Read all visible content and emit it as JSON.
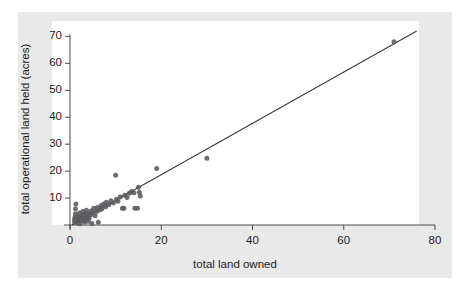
{
  "chart_data": {
    "type": "scatter",
    "title": "",
    "xlabel": "total land owned",
    "ylabel": "total operational land held (acres)",
    "xlim": [
      0,
      80
    ],
    "ylim": [
      0,
      72
    ],
    "xticks": [
      0,
      20,
      40,
      60,
      80
    ],
    "yticks": [
      10,
      20,
      30,
      40,
      50,
      60,
      70
    ],
    "grid": false,
    "legend": null,
    "point_color": "#5a5a60",
    "line_color": "#3c3c42",
    "panel_color": "#ffffff",
    "figure_color": "#e9e9e9",
    "fit_line": {
      "type": "linear",
      "x_start": 0.4,
      "y_start": 0.0,
      "x_end": 76.0,
      "y_end": 72.0
    },
    "points": [
      [
        1.0,
        1.0
      ],
      [
        1.0,
        2.0
      ],
      [
        1.1,
        3.0
      ],
      [
        1.2,
        4.2
      ],
      [
        1.2,
        6.0
      ],
      [
        1.3,
        7.8
      ],
      [
        1.4,
        1.2
      ],
      [
        1.5,
        2.4
      ],
      [
        1.6,
        0.8
      ],
      [
        1.8,
        3.4
      ],
      [
        2.0,
        1.5
      ],
      [
        2.0,
        2.8
      ],
      [
        2.1,
        4.5
      ],
      [
        2.2,
        0.5
      ],
      [
        2.4,
        2.0
      ],
      [
        2.5,
        3.2
      ],
      [
        2.6,
        1.8
      ],
      [
        2.8,
        5.0
      ],
      [
        3.0,
        2.2
      ],
      [
        3.0,
        3.6
      ],
      [
        3.2,
        1.0
      ],
      [
        3.4,
        4.0
      ],
      [
        3.5,
        2.6
      ],
      [
        3.6,
        5.5
      ],
      [
        3.8,
        3.0
      ],
      [
        4.0,
        4.4
      ],
      [
        4.0,
        1.4
      ],
      [
        4.2,
        2.5
      ],
      [
        4.5,
        3.8
      ],
      [
        4.6,
        5.2
      ],
      [
        4.8,
        0.6
      ],
      [
        5.0,
        4.6
      ],
      [
        5.2,
        6.2
      ],
      [
        5.5,
        3.4
      ],
      [
        5.8,
        5.0
      ],
      [
        6.0,
        6.5
      ],
      [
        6.2,
        1.0
      ],
      [
        6.5,
        5.6
      ],
      [
        6.8,
        7.2
      ],
      [
        7.0,
        6.0
      ],
      [
        7.4,
        7.8
      ],
      [
        7.8,
        6.8
      ],
      [
        8.0,
        8.4
      ],
      [
        8.5,
        7.5
      ],
      [
        9.0,
        9.0
      ],
      [
        9.5,
        8.2
      ],
      [
        10.0,
        18.5
      ],
      [
        10.2,
        9.6
      ],
      [
        10.5,
        8.8
      ],
      [
        11.0,
        10.4
      ],
      [
        11.5,
        6.2
      ],
      [
        11.8,
        6.2
      ],
      [
        12.0,
        11.0
      ],
      [
        12.5,
        10.2
      ],
      [
        13.0,
        11.8
      ],
      [
        13.5,
        12.4
      ],
      [
        14.0,
        12.0
      ],
      [
        14.2,
        6.2
      ],
      [
        14.8,
        6.2
      ],
      [
        15.0,
        14.0
      ],
      [
        15.2,
        12.2
      ],
      [
        15.4,
        10.8
      ],
      [
        19.0,
        21.0
      ],
      [
        30.0,
        24.8
      ],
      [
        71.0,
        68.0
      ]
    ]
  }
}
